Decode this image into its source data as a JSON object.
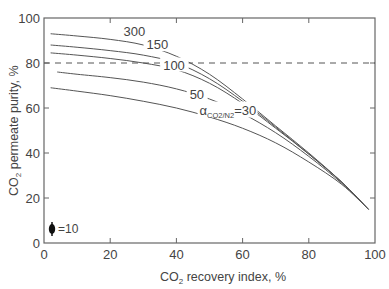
{
  "chart_data": {
    "type": "line",
    "title": "",
    "xlabel": "CO2 recovery index, %",
    "xlabel_main": "CO",
    "xlabel_sub": "2",
    "xlabel_rest": " recovery index, %",
    "ylabel": "CO2 permeate purity, %",
    "ylabel_main": "CO",
    "ylabel_sub": "2",
    "ylabel_rest": " permeate purity, %",
    "xlim": [
      0,
      100
    ],
    "ylim": [
      0,
      100
    ],
    "xticks": [
      0,
      20,
      40,
      60,
      80,
      100
    ],
    "yticks": [
      0,
      20,
      40,
      60,
      80,
      100
    ],
    "grid": false,
    "reference_line": {
      "y": 80,
      "style": "dashed"
    },
    "series": [
      {
        "name": "300",
        "label": "300",
        "x": [
          2,
          10,
          20,
          30,
          40,
          50,
          60,
          70,
          80,
          90,
          98
        ],
        "y": [
          93,
          92,
          90.5,
          88,
          83,
          75,
          64,
          52,
          40,
          27,
          15
        ]
      },
      {
        "name": "150",
        "label": "150",
        "x": [
          2,
          10,
          20,
          30,
          40,
          50,
          60,
          70,
          80,
          90,
          98
        ],
        "y": [
          88,
          87,
          85.5,
          83.5,
          80,
          73,
          63,
          51.5,
          39.5,
          27,
          15
        ]
      },
      {
        "name": "100",
        "label": "100",
        "x": [
          2,
          10,
          20,
          30,
          40,
          50,
          60,
          70,
          80,
          90,
          98
        ],
        "y": [
          84.5,
          83.5,
          82,
          80,
          77,
          71,
          62,
          51,
          39.5,
          27,
          15
        ]
      },
      {
        "name": "50",
        "label": "50",
        "x": [
          4,
          10,
          20,
          30,
          40,
          50,
          60,
          70,
          80,
          90,
          98
        ],
        "y": [
          76,
          75,
          73.5,
          71.5,
          68.5,
          64,
          57.5,
          49,
          38.5,
          26.5,
          15
        ]
      },
      {
        "name": "30",
        "label": "αCO2/N2=30",
        "x": [
          2,
          10,
          20,
          30,
          40,
          50,
          60,
          70,
          80,
          90,
          98
        ],
        "y": [
          69,
          67.5,
          65.5,
          63,
          60,
          56,
          51,
          44.5,
          36,
          26,
          15
        ]
      }
    ],
    "annotations": [
      {
        "text": "300",
        "x": 24,
        "y": 93
      },
      {
        "text": "150",
        "x": 31,
        "y": 87
      },
      {
        "text": "100",
        "x": 36,
        "y": 78
      },
      {
        "text": "50",
        "x": 44,
        "y": 65
      },
      {
        "text": "αCO2/N2=30",
        "x": 47,
        "y": 58
      },
      {
        "text": "=10",
        "x": 5,
        "y": 6,
        "note": "error bar size"
      }
    ],
    "legend": {
      "error_bar_label": "=10"
    }
  }
}
